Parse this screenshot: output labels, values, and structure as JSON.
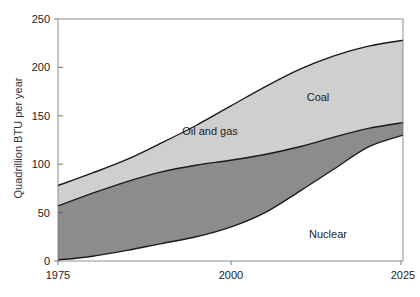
{
  "chart_data": {
    "type": "area",
    "stacked": false,
    "title": "",
    "xlabel": "",
    "ylabel": "Quadrillion BTU per year",
    "xlim": [
      1975,
      2025
    ],
    "ylim": [
      0,
      250
    ],
    "x_ticks": [
      "1975",
      "2000",
      "2025"
    ],
    "y_ticks": [
      "0",
      "50",
      "100",
      "150",
      "200",
      "250"
    ],
    "grid": false,
    "legend": "none (labels inside areas)",
    "x": [
      1975,
      1980,
      1985,
      1990,
      1995,
      2000,
      2005,
      2010,
      2015,
      2020,
      2025
    ],
    "boundaries": [
      {
        "name": "Nuclear / Oil and gas boundary",
        "values": [
          1,
          5,
          11,
          18,
          25,
          35,
          50,
          72,
          95,
          118,
          130
        ]
      },
      {
        "name": "Oil and gas / Coal boundary",
        "values": [
          57,
          70,
          82,
          92,
          99,
          104,
          110,
          118,
          128,
          137,
          143
        ]
      },
      {
        "name": "Coal upper boundary (total)",
        "values": [
          78,
          91,
          105,
          122,
          140,
          160,
          180,
          198,
          212,
          222,
          228
        ]
      }
    ],
    "series": [
      {
        "name": "Nuclear",
        "color": "#ffffff",
        "values": [
          1,
          5,
          11,
          18,
          25,
          35,
          50,
          72,
          95,
          118,
          130
        ]
      },
      {
        "name": "Oil and gas",
        "color": "#8c8c8c",
        "values": [
          56,
          65,
          71,
          74,
          74,
          69,
          60,
          46,
          33,
          19,
          13
        ]
      },
      {
        "name": "Coal",
        "color": "#cfcfcf",
        "values": [
          21,
          21,
          23,
          30,
          41,
          56,
          70,
          80,
          84,
          85,
          85
        ]
      }
    ],
    "annotations": [
      {
        "text": "Coal",
        "x": 2015,
        "y": 168
      },
      {
        "text": "Oil and gas",
        "x": 2001,
        "y": 134
      },
      {
        "text": "Nuclear",
        "x": 2016,
        "y": 28
      }
    ]
  },
  "labels": {
    "ylabel": "Quadrillion BTU per year",
    "coal": "Coal",
    "oil_gas": "Oil and gas",
    "nuclear": "Nuclear",
    "y0": "0",
    "y50": "50",
    "y100": "100",
    "y150": "150",
    "y200": "200",
    "y250": "250",
    "x1975": "1975",
    "x2000": "2000",
    "x2025": "2025"
  },
  "colors": {
    "coal": "#cfcfcf",
    "oil_gas": "#8c8c8c",
    "nuclear": "#ffffff",
    "axis": "#555555",
    "line": "#1a1a1a"
  }
}
